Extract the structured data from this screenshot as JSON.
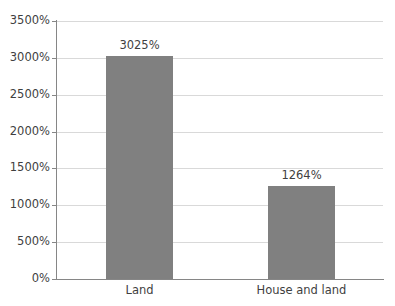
{
  "chart_data": {
    "type": "bar",
    "title": "",
    "subtitle": "",
    "xlabel": "",
    "ylabel": "",
    "categories": [
      "Land",
      "House and land"
    ],
    "values": [
      3025,
      1264
    ],
    "value_labels": [
      "3025%",
      "1264%"
    ],
    "series": [
      {
        "name": "",
        "values": [
          3025,
          1264
        ]
      }
    ],
    "ylim": [
      0,
      3500
    ],
    "ytick_values": [
      0,
      500,
      1000,
      1500,
      2000,
      2500,
      3000,
      3500
    ],
    "ytick_labels": [
      "0%",
      "500%",
      "1000%",
      "1500%",
      "2000%",
      "2500%",
      "3000%",
      "3500%"
    ],
    "grid": true,
    "legend": false,
    "legend_position": "none",
    "bar_color": "#808080",
    "gridline_color": "#d9d9d9",
    "axis_color": "#868686",
    "text_color": "#3f3f3f",
    "background_color": "#ffffff"
  }
}
